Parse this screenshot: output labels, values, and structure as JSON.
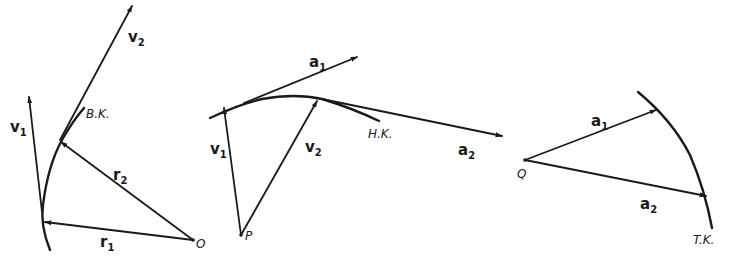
{
  "figure": {
    "panels": [
      {
        "id": "position-vectors",
        "origin_label": "O",
        "curve_label": "B.K.",
        "vectors": [
          {
            "symbol": "r",
            "index": "1"
          },
          {
            "symbol": "r",
            "index": "2"
          },
          {
            "symbol": "v",
            "index": "1"
          },
          {
            "symbol": "v",
            "index": "2"
          }
        ]
      },
      {
        "id": "velocity-hodograph",
        "origin_label": "P",
        "curve_label": "H.K.",
        "vectors": [
          {
            "symbol": "v",
            "index": "1"
          },
          {
            "symbol": "v",
            "index": "2"
          },
          {
            "symbol": "a",
            "index": "1"
          },
          {
            "symbol": "a",
            "index": "2"
          }
        ]
      },
      {
        "id": "acceleration-curve",
        "origin_label": "Q",
        "curve_label": "T.K.",
        "vectors": [
          {
            "symbol": "a",
            "index": "1"
          },
          {
            "symbol": "a",
            "index": "2"
          }
        ]
      }
    ]
  }
}
